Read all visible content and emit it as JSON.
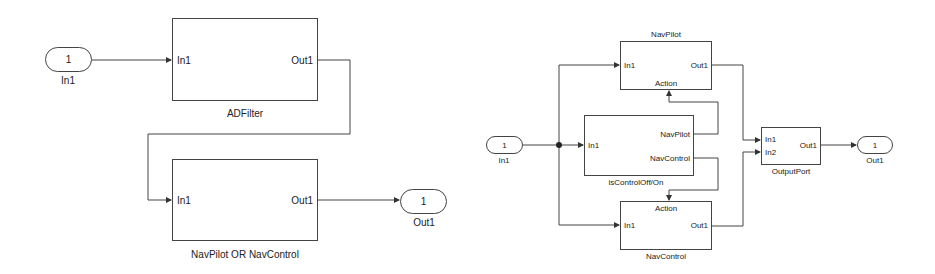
{
  "left_diagram": {
    "inport": {
      "number": "1",
      "name": "In1"
    },
    "blocks": [
      {
        "name": "ADFilter",
        "in_port": "In1",
        "out_port": "Out1"
      },
      {
        "name": "NavPilot OR NavControl",
        "in_port": "In1",
        "out_port": "Out1"
      }
    ],
    "outport": {
      "number": "1",
      "name": "Out1"
    }
  },
  "right_diagram": {
    "inport": {
      "number": "1",
      "name": "In1"
    },
    "nav_pilot": {
      "name": "NavPilot",
      "in_port": "In1",
      "out_port": "Out1",
      "action_port": "Action"
    },
    "switch": {
      "name": "isControlOff/On",
      "in_port": "In1",
      "out_ports": [
        "NavPilot",
        "NavControl"
      ]
    },
    "nav_control": {
      "name": "NavControl",
      "in_port": "In1",
      "out_port": "Out1",
      "action_port": "Action"
    },
    "merge": {
      "name": "OutputPort",
      "in_ports": [
        "In1",
        "In2"
      ],
      "out_port": "Out1"
    },
    "outport": {
      "number": "1",
      "name": "Out1"
    }
  }
}
